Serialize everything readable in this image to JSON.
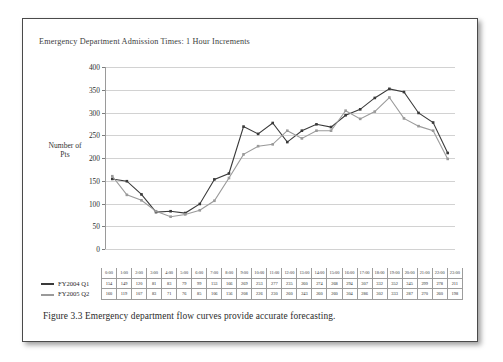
{
  "figure": {
    "title": "Emergency Department Admission Times: 1 Hour Increments",
    "caption": "Figure 3.3 Emergency department flow curves provide accurate forecasting."
  },
  "chart_data": {
    "type": "line",
    "title": "Emergency Department Admission Times: 1 Hour Increments",
    "xlabel": "",
    "ylabel": "Number of Pts",
    "ylim": [
      0,
      400
    ],
    "ytick_step": 50,
    "yticks": [
      0,
      50,
      100,
      150,
      200,
      250,
      300,
      350,
      400
    ],
    "grid": true,
    "legend_position": "table-left",
    "categories": [
      "0:00",
      "1:00",
      "2:00",
      "3:00",
      "4:00",
      "5:00",
      "6:00",
      "7:00",
      "8:00",
      "9:00",
      "10:00",
      "11:00",
      "12:00",
      "13:00",
      "14:00",
      "15:00",
      "16:00",
      "17:00",
      "18:00",
      "19:00",
      "20:00",
      "21:00",
      "22:00",
      "23:00"
    ],
    "series": [
      {
        "name": "FY2004 Q1",
        "color": "#3a3a3a",
        "values": [
          154,
          149,
          120,
          81,
          83,
          79,
          99,
          153,
          166,
          269,
          253,
          277,
          235,
          260,
          274,
          268,
          294,
          307,
          332,
          352,
          345,
          299,
          278,
          211
        ]
      },
      {
        "name": "FY2005 Q2",
        "color": "#9a9a9a",
        "values": [
          160,
          119,
          107,
          83,
          71,
          76,
          85,
          106,
          156,
          208,
          226,
          230,
          260,
          243,
          260,
          260,
          304,
          286,
          302,
          333,
          287,
          270,
          260,
          198
        ]
      }
    ]
  }
}
